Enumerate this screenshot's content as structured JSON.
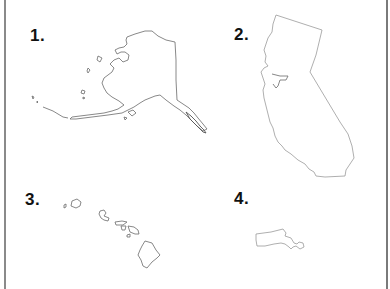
{
  "worksheet": {
    "items": [
      {
        "number": "1.",
        "state": "Alaska"
      },
      {
        "number": "2.",
        "state": "California"
      },
      {
        "number": "3.",
        "state": "Hawaii"
      },
      {
        "number": "4.",
        "state": "Massachusetts"
      }
    ]
  }
}
